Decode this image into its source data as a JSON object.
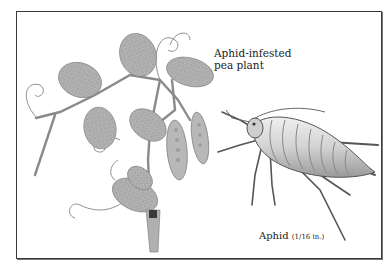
{
  "figure": {
    "labels": {
      "plant": [
        "Aphid-infested",
        "pea plant"
      ],
      "aphid": "Aphid",
      "aphid_size": "(1/16 in.)"
    },
    "subjects": [
      {
        "name": "pea-plant",
        "description": "Aphid-infested pea plant with leaves, tendrils and pea pods"
      },
      {
        "name": "aphid",
        "description": "Enlarged aphid insect drawing"
      }
    ],
    "colors": {
      "border": "#3a3a3a",
      "leaf": "#a9a9a9",
      "leaf_dark": "#7a7a7a",
      "stem": "#8a8a8a",
      "aphid_body": "#d8d8d8",
      "aphid_outline": "#555555",
      "text": "#222222"
    }
  }
}
